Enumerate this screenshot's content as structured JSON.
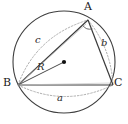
{
  "figure": {
    "type": "geometry-diagram",
    "background_color": "#ffffff",
    "stroke_color": "#3a3a3a",
    "dashed_color": "#9a9a9a",
    "center_dot_color": "#111111",
    "vertices": [
      {
        "id": "A",
        "label": "A",
        "x": 88,
        "y": 20,
        "label_x": 84,
        "label_y": 2
      },
      {
        "id": "B",
        "label": "B",
        "x": 18,
        "y": 85,
        "label_x": 4,
        "label_y": 79
      },
      {
        "id": "C",
        "label": "C",
        "x": 113,
        "y": 85,
        "label_x": 115,
        "label_y": 79
      }
    ],
    "circle": {
      "center_x": 64,
      "center_y": 62,
      "radius": 51
    },
    "center_point": {
      "label": "",
      "x": 64,
      "y": 62,
      "dot_radius": 2.1
    },
    "radius_segment": {
      "label": "R",
      "from": "B",
      "to": "center",
      "label_x": 38,
      "label_y": 65
    },
    "sides": [
      {
        "label": "a",
        "opposite": "A",
        "from": "B",
        "to": "C",
        "label_x": 58,
        "label_y": 96,
        "arc_dashed": true
      },
      {
        "label": "b",
        "opposite": "B",
        "from": "A",
        "to": "C",
        "label_x": 102,
        "label_y": 40,
        "arc_dashed": true
      },
      {
        "label": "c",
        "opposite": "C",
        "from": "A",
        "to": "B",
        "label_x": 36,
        "label_y": 37,
        "arc_dashed": true
      }
    ],
    "angle_marks": [
      {
        "at": "A",
        "type": "arc",
        "radius": 9
      }
    ]
  }
}
